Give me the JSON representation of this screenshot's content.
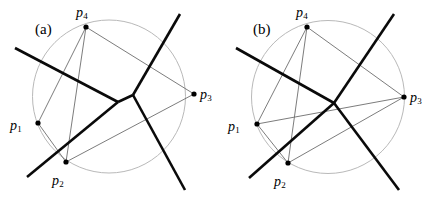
{
  "figure": {
    "width": 436,
    "height": 202,
    "background": "#ffffff",
    "kind": "geometry-diagram"
  },
  "colors": {
    "circle": "#b9b9b9",
    "thin_edge": "#6d6d6d",
    "thick_edge": "#0a0a0a",
    "site_dot": "#000000",
    "text": "#000000"
  },
  "panels": [
    {
      "id": "a",
      "caption": "(a)",
      "caption_pos": {
        "x": 35,
        "y": 22
      },
      "circle": {
        "cx": 109,
        "cy": 96.5,
        "r": 76.5
      },
      "sites": [
        {
          "id": "p1",
          "label": "p",
          "sub": "1",
          "x": 38,
          "y": 123,
          "label_x": 10,
          "label_y": 119,
          "on_circle": true
        },
        {
          "id": "p2",
          "label": "p",
          "sub": "2",
          "x": 66,
          "y": 162,
          "label_x": 52,
          "label_y": 174,
          "on_circle": true
        },
        {
          "id": "p3",
          "label": "p",
          "sub": "3",
          "x": 194,
          "y": 94,
          "label_x": 200,
          "label_y": 88,
          "on_circle": false
        },
        {
          "id": "p4",
          "label": "p",
          "sub": "4",
          "x": 86,
          "y": 27,
          "label_x": 76,
          "label_y": 6,
          "on_circle": true
        }
      ],
      "thin_edges": [
        {
          "from": "p1",
          "to": "p4"
        },
        {
          "from": "p1",
          "to": "p2"
        },
        {
          "from": "p2",
          "to": "p4"
        },
        {
          "from": "p2",
          "to": "p3"
        },
        {
          "from": "p3",
          "to": "p4"
        }
      ],
      "voronoi_vertices": [
        {
          "id": "v1",
          "x": 118,
          "y": 102
        },
        {
          "id": "v2",
          "x": 133,
          "y": 95
        }
      ],
      "thick_edges": [
        {
          "from": {
            "x": 15,
            "y": 48
          },
          "to": {
            "x": 118,
            "y": 102
          },
          "note": "bisector p1p4 ray"
        },
        {
          "from": {
            "x": 118,
            "y": 102
          },
          "to": {
            "x": 133,
            "y": 95
          },
          "note": "finite Voronoi edge"
        },
        {
          "from": {
            "x": 133,
            "y": 95
          },
          "to": {
            "x": 180,
            "y": 14
          },
          "note": "bisector p3p4 ray"
        },
        {
          "from": {
            "x": 133,
            "y": 95
          },
          "to": {
            "x": 185,
            "y": 190
          },
          "note": "bisector p2p3 ray"
        },
        {
          "from": {
            "x": 118,
            "y": 102
          },
          "to": {
            "x": 27,
            "y": 177
          },
          "note": "bisector p1p2 ray"
        }
      ],
      "degenerate": false
    },
    {
      "id": "b",
      "caption": "(b)",
      "caption_pos": {
        "x": 253,
        "y": 22
      },
      "circle": {
        "cx": 328,
        "cy": 97,
        "r": 76.5
      },
      "sites": [
        {
          "id": "p1",
          "label": "p",
          "sub": "1",
          "x": 257,
          "y": 124,
          "label_x": 228,
          "label_y": 120,
          "on_circle": true
        },
        {
          "id": "p2",
          "label": "p",
          "sub": "2",
          "x": 288,
          "y": 163,
          "label_x": 274,
          "label_y": 175,
          "on_circle": true
        },
        {
          "id": "p3",
          "label": "p",
          "sub": "3",
          "x": 404,
          "y": 97,
          "label_x": 410,
          "label_y": 91,
          "on_circle": true
        },
        {
          "id": "p4",
          "label": "p",
          "sub": "4",
          "x": 307,
          "y": 27,
          "label_x": 296,
          "label_y": 6,
          "on_circle": true
        }
      ],
      "thin_edges": [
        {
          "from": "p1",
          "to": "p4"
        },
        {
          "from": "p1",
          "to": "p2"
        },
        {
          "from": "p2",
          "to": "p4"
        },
        {
          "from": "p2",
          "to": "p3"
        },
        {
          "from": "p3",
          "to": "p4"
        },
        {
          "from": "p1",
          "to": "p3"
        }
      ],
      "voronoi_vertices": [
        {
          "id": "v1",
          "x": 334,
          "y": 103
        }
      ],
      "thick_edges": [
        {
          "from": {
            "x": 236,
            "y": 48
          },
          "to": {
            "x": 334,
            "y": 103
          },
          "note": "bisector p1p4 ray"
        },
        {
          "from": {
            "x": 334,
            "y": 103
          },
          "to": {
            "x": 394,
            "y": 14
          },
          "note": "bisector p3p4 ray"
        },
        {
          "from": {
            "x": 334,
            "y": 103
          },
          "to": {
            "x": 399,
            "y": 190
          },
          "note": "bisector p2p3 ray"
        },
        {
          "from": {
            "x": 334,
            "y": 103
          },
          "to": {
            "x": 249,
            "y": 178
          },
          "note": "bisector p1p2 ray"
        }
      ],
      "degenerate": true
    }
  ]
}
